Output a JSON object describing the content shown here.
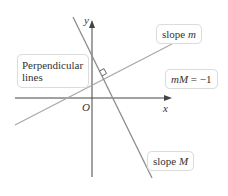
{
  "diagram": {
    "title": "Perpendicular lines",
    "axes": {
      "x_label": "x",
      "y_label": "y",
      "origin_label": "O"
    },
    "lines": [
      {
        "name": "line-m",
        "label_prefix": "slope ",
        "label_var": "m",
        "color": "#a8a8a8"
      },
      {
        "name": "line-M",
        "label_prefix": "slope ",
        "label_var": "M",
        "color": "#8c8c8c"
      }
    ],
    "callouts": {
      "perpendicular_line1": "Perpendicular",
      "perpendicular_line2": "lines",
      "relation_lhs": "mM",
      "relation_rhs": " = −1"
    },
    "colors": {
      "axis": "#444444",
      "line_m": "#a8a8a8",
      "line_M": "#8c8c8c",
      "box_border": "#dcdcdc"
    }
  }
}
